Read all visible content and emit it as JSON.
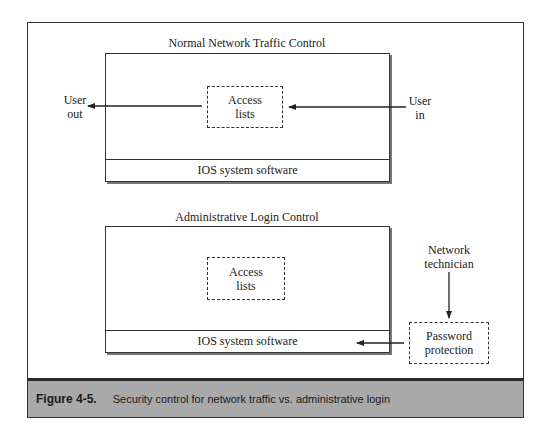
{
  "diagram": {
    "top_panel": {
      "title": "Normal Network Traffic Control",
      "access_lists_label_line1": "Access",
      "access_lists_label_line2": "lists",
      "ios_label": "IOS system software",
      "user_out_line1": "User",
      "user_out_line2": "out",
      "user_in_line1": "User",
      "user_in_line2": "in"
    },
    "bottom_panel": {
      "title": "Administrative Login Control",
      "access_lists_label_line1": "Access",
      "access_lists_label_line2": "lists",
      "ios_label": "IOS system software",
      "technician_line1": "Network",
      "technician_line2": "technician",
      "password_line1": "Password",
      "password_line2": "protection"
    },
    "caption": {
      "figure_number": "Figure 4-5.",
      "text": "Security control for network traffic vs. administrative login"
    },
    "colors": {
      "line": "#333333",
      "caption_background": "#a9a9a9",
      "caption_top_border": "#2a2a2a"
    }
  }
}
